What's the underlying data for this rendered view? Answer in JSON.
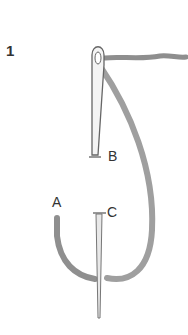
{
  "diagram": {
    "step_number": "1",
    "labels": {
      "a": "A",
      "b": "B",
      "c": "C"
    },
    "colors": {
      "thread": "#9a9a9a",
      "needle_outline": "#666666",
      "text": "#333333"
    }
  }
}
